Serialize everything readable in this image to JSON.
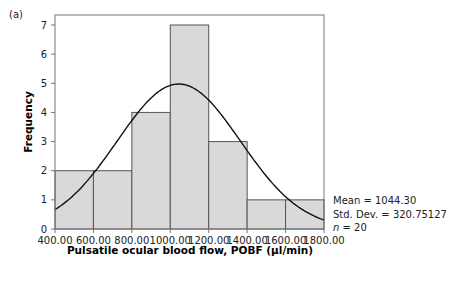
{
  "panel_label": "(a)",
  "stats": {
    "mean": "Mean = 1044.30",
    "std": "Std. Dev. = 320.75127",
    "n_label": "n",
    "n_value": " = 20"
  },
  "colors": {
    "bar_fill": "#d9d9d9",
    "bar_stroke": "#555555",
    "curve": "#111111",
    "frame": "#777777"
  },
  "chart_data": {
    "type": "bar",
    "subtype": "histogram with normal curve overlay",
    "title": "",
    "xlabel": "Pulsatile ocular blood flow, POBF (µl/min)",
    "ylabel": "Frequency",
    "bin_edges": [
      400,
      600,
      800,
      1000,
      1200,
      1400,
      1600,
      1800
    ],
    "categories": [
      "400-600",
      "600-800",
      "800-1000",
      "1000-1200",
      "1200-1400",
      "1400-1600",
      "1600-1800"
    ],
    "values": [
      2,
      2,
      4,
      7,
      3,
      1,
      1
    ],
    "x_ticks": [
      "400.00",
      "600.00",
      "800.00",
      "1000.00",
      "1200.00",
      "1400.00",
      "1600.00",
      "1800.00"
    ],
    "y_ticks": [
      "0",
      "1",
      "2",
      "3",
      "4",
      "5",
      "6",
      "7"
    ],
    "xlim": [
      400,
      1800
    ],
    "ylim": [
      0,
      7
    ],
    "grid": false,
    "normal_curve": {
      "mean": 1044.3,
      "std_dev": 320.75127,
      "n": 20,
      "bin_width": 200
    },
    "annotations": [
      "Mean = 1044.30",
      "Std. Dev. = 320.75127",
      "n = 20"
    ]
  }
}
